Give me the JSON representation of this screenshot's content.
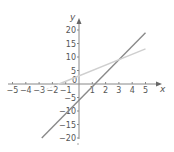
{
  "chart_data": {
    "type": "line",
    "title": "",
    "xlabel": "x",
    "ylabel": "y",
    "xlim": [
      -5,
      5
    ],
    "ylim": [
      -20,
      20
    ],
    "x_ticks": [
      -5,
      -4,
      -3,
      -2,
      -1,
      1,
      2,
      3,
      4,
      5
    ],
    "y_ticks": [
      20,
      15,
      10,
      5,
      0,
      -5,
      -10,
      -15,
      -20
    ],
    "origin_label": "0",
    "grid": false,
    "series": [
      {
        "name": "y = 5x - 6",
        "color": "#8a8a8a",
        "x": [
          -2.8,
          5
        ],
        "y": [
          -20,
          19
        ]
      },
      {
        "name": "y = 2x + 3",
        "color": "#cfcfcf",
        "x": [
          -1.5,
          5
        ],
        "y": [
          0,
          13
        ]
      }
    ],
    "intersection": {
      "x": 3,
      "y": 9
    }
  }
}
